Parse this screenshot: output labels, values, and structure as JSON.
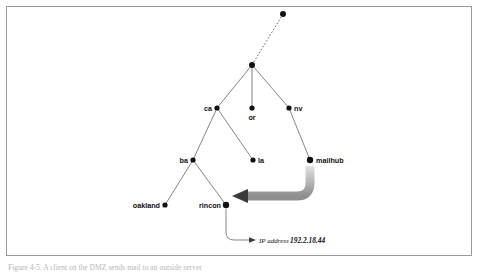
{
  "figure": {
    "caption": "Figure 4-5.  A client on the DMZ sends mail to an outside server",
    "frame_color": "#9a9a9a",
    "background": "#ffffff"
  },
  "diagram": {
    "type": "tree",
    "node_color": "#111111",
    "edge_color": "#6f6f6f",
    "arrow_color_start": "#d8d8d8",
    "arrow_color_end": "#3a3a3a",
    "nodes": [
      {
        "id": "root",
        "label": "",
        "x": 283,
        "y": 14,
        "r": 3.0,
        "label_side": "none"
      },
      {
        "id": "hub",
        "label": "",
        "x": 252,
        "y": 65,
        "r": 3.0,
        "label_side": "none"
      },
      {
        "id": "ca",
        "label": "ca",
        "x": 217,
        "y": 108,
        "r": 2.6,
        "label_side": "left"
      },
      {
        "id": "or",
        "label": "or",
        "x": 252,
        "y": 108,
        "r": 2.6,
        "label_side": "below"
      },
      {
        "id": "nv",
        "label": "nv",
        "x": 289,
        "y": 108,
        "r": 2.6,
        "label_side": "right"
      },
      {
        "id": "ba",
        "label": "ba",
        "x": 193,
        "y": 160,
        "r": 2.6,
        "label_side": "left"
      },
      {
        "id": "la",
        "label": "la",
        "x": 253,
        "y": 160,
        "r": 2.6,
        "label_side": "right"
      },
      {
        "id": "mailhub",
        "label": "mailhub",
        "x": 310,
        "y": 160,
        "r": 3.2,
        "label_side": "right"
      },
      {
        "id": "oakland",
        "label": "oakland",
        "x": 165,
        "y": 205,
        "r": 2.6,
        "label_side": "left"
      },
      {
        "id": "rincon",
        "label": "rincon",
        "x": 226,
        "y": 205,
        "r": 3.2,
        "label_side": "left"
      }
    ],
    "edges": [
      {
        "from": "root",
        "to": "hub",
        "style": "dotted"
      },
      {
        "from": "hub",
        "to": "ca",
        "style": "solid"
      },
      {
        "from": "hub",
        "to": "or",
        "style": "solid"
      },
      {
        "from": "hub",
        "to": "nv",
        "style": "solid"
      },
      {
        "from": "ca",
        "to": "ba",
        "style": "solid"
      },
      {
        "from": "ca",
        "to": "la",
        "style": "solid"
      },
      {
        "from": "nv",
        "to": "mailhub",
        "style": "solid"
      },
      {
        "from": "ba",
        "to": "oakland",
        "style": "solid"
      },
      {
        "from": "ba",
        "to": "rincon",
        "style": "solid"
      }
    ],
    "flow_arrow": {
      "from": "mailhub",
      "to": "rincon",
      "description": "thick curved gradient arrow from mailhub down and left into rincon"
    },
    "annotation": {
      "target": "rincon",
      "prefix": "IP address",
      "value": "192.2.18.44",
      "leader": "curved line from rincon down to label with small arrowhead"
    }
  }
}
